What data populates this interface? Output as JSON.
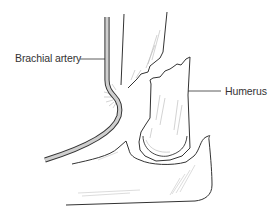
{
  "figure": {
    "labels": {
      "brachial_artery": "Brachial artery",
      "humerus": "Humerus"
    },
    "colors": {
      "line": "#333333",
      "artery_fill": "#cfcfcf",
      "shading": "#b5b5b5",
      "label_text": "#333333",
      "background": "#ffffff"
    }
  }
}
